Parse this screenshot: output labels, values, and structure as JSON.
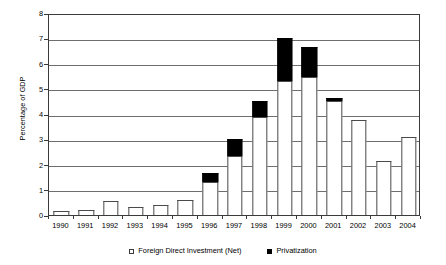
{
  "chart_data": {
    "type": "bar",
    "stacked": true,
    "title": "",
    "subtitle": "",
    "xlabel": "",
    "ylabel": "Percentage of GDP",
    "ylim": [
      0,
      8
    ],
    "ytick_step": 1,
    "yticks": [
      "0",
      "1",
      "2",
      "3",
      "4",
      "5",
      "6",
      "7",
      "8"
    ],
    "grid": true,
    "grid_axis": "y",
    "legend_position": "bottom-center",
    "categories": [
      "1990",
      "1991",
      "1992",
      "1993",
      "1994",
      "1995",
      "1996",
      "1997",
      "1998",
      "1999",
      "2000",
      "2001",
      "2002",
      "2003",
      "2004"
    ],
    "series": [
      {
        "name": "Foreign Direct Investment (Net)",
        "color": "#ffffff",
        "edge_color": "#4a4a4a",
        "marker": "hollow-square",
        "values": [
          0.15,
          0.2,
          0.55,
          0.3,
          0.4,
          0.6,
          1.3,
          2.35,
          3.9,
          5.3,
          5.45,
          4.5,
          3.75,
          2.15,
          3.1
        ]
      },
      {
        "name": "Privatization",
        "color": "#000000",
        "edge_color": "#000000",
        "marker": "solid-square",
        "values": [
          0,
          0,
          0,
          0,
          0,
          0,
          0.35,
          0.65,
          0.6,
          1.7,
          1.2,
          0.15,
          0,
          0,
          0
        ]
      }
    ],
    "totals": [
      0.15,
      0.2,
      0.55,
      0.3,
      0.4,
      0.6,
      1.65,
      3.0,
      4.5,
      7.0,
      6.65,
      4.65,
      3.75,
      2.15,
      3.1
    ]
  },
  "legend": {
    "entries": [
      {
        "label": "Foreign Direct Investment (Net)"
      },
      {
        "label": "Privatization"
      }
    ]
  }
}
